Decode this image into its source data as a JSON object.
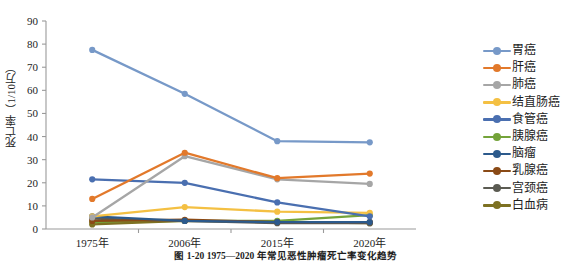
{
  "axis": {
    "y_title": "死亡率（1/10万）",
    "y_ticks": [
      "0",
      "10",
      "20",
      "30",
      "40",
      "50",
      "60",
      "70",
      "80",
      "90"
    ],
    "x_ticks": [
      "1975年",
      "2006年",
      "2015年",
      "2020年"
    ]
  },
  "caption": "图 1-20   1975—2020 年常见恶性肿瘤死亡率变化趋势",
  "legend": {
    "items": [
      {
        "label": "胃癌",
        "color": "#7799c8"
      },
      {
        "label": "肝癌",
        "color": "#e2792b"
      },
      {
        "label": "肺癌",
        "color": "#a6a6a6"
      },
      {
        "label": "结直肠癌",
        "color": "#f4c043"
      },
      {
        "label": "食管癌",
        "color": "#4a6fb0"
      },
      {
        "label": "胰腺癌",
        "color": "#74a33a"
      },
      {
        "label": "脑瘤",
        "color": "#2c5a8c"
      },
      {
        "label": "乳腺癌",
        "color": "#8a4a16"
      },
      {
        "label": "宫颈癌",
        "color": "#5b5b52"
      },
      {
        "label": "白血病",
        "color": "#7d7122"
      }
    ]
  },
  "chart_data": {
    "type": "line",
    "title": "",
    "xlabel": "",
    "ylabel": "死亡率（1/10万）",
    "categories": [
      "1975年",
      "2006年",
      "2015年",
      "2020年"
    ],
    "ylim": [
      0,
      90
    ],
    "ytick_step": 10,
    "grid": false,
    "legend_position": "right",
    "series": [
      {
        "name": "胃癌",
        "color": "#7799c8",
        "values": [
          77.5,
          58.5,
          38.0,
          37.5
        ]
      },
      {
        "name": "肝癌",
        "color": "#e2792b",
        "values": [
          13.0,
          33.0,
          22.0,
          24.0
        ]
      },
      {
        "name": "肺癌",
        "color": "#a6a6a6",
        "values": [
          5.0,
          31.5,
          21.5,
          19.5
        ]
      },
      {
        "name": "结直肠癌",
        "color": "#f4c043",
        "values": [
          5.5,
          9.5,
          7.5,
          7.0
        ]
      },
      {
        "name": "食管癌",
        "color": "#4a6fb0",
        "values": [
          21.5,
          20.0,
          11.5,
          5.5
        ]
      },
      {
        "name": "胰腺癌",
        "color": "#74a33a",
        "values": [
          3.0,
          3.5,
          3.5,
          6.0
        ]
      },
      {
        "name": "脑瘤",
        "color": "#2c5a8c",
        "values": [
          5.5,
          3.5,
          3.0,
          3.0
        ]
      },
      {
        "name": "乳腺癌",
        "color": "#8a4a16",
        "values": [
          3.5,
          4.0,
          3.0,
          3.0
        ]
      },
      {
        "name": "宫颈癌",
        "color": "#5b5b52",
        "values": [
          4.5,
          3.5,
          2.5,
          2.5
        ]
      },
      {
        "name": "白血病",
        "color": "#7d7122",
        "values": [
          2.0,
          3.5,
          3.0,
          2.5
        ]
      }
    ]
  }
}
